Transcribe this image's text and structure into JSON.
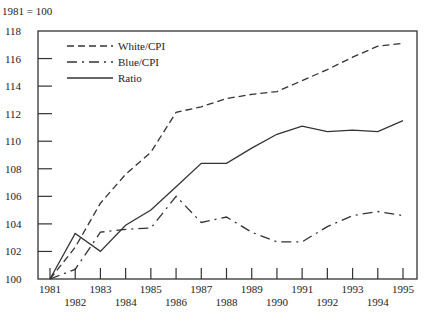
{
  "chart_data": {
    "type": "line",
    "title": "",
    "index_note": "1981 = 100",
    "xlabel": "",
    "ylabel": "",
    "x": [
      1981,
      1982,
      1983,
      1984,
      1985,
      1986,
      1987,
      1988,
      1989,
      1990,
      1991,
      1992,
      1993,
      1994,
      1995
    ],
    "x_tick_labels": [
      "1981",
      "1982",
      "1983",
      "1984",
      "1985",
      "1986",
      "1987",
      "1988",
      "1989",
      "1990",
      "1991",
      "1992",
      "1993",
      "1994",
      "1995"
    ],
    "y_ticks": [
      100,
      102,
      104,
      106,
      108,
      110,
      112,
      114,
      116,
      118
    ],
    "y_tick_labels": [
      "100",
      "102",
      "104",
      "106",
      "108",
      "110",
      "112",
      "114",
      "116",
      "118"
    ],
    "ylim": [
      100,
      118
    ],
    "xlim": [
      1981,
      1995
    ],
    "grid": false,
    "legend_position": "upper-left inside",
    "series": [
      {
        "name": "White/CPI",
        "style": "dashed",
        "values": [
          100.0,
          102.3,
          105.5,
          107.6,
          109.2,
          112.1,
          112.5,
          113.1,
          113.4,
          113.6,
          114.4,
          115.2,
          116.1,
          116.9,
          117.1
        ]
      },
      {
        "name": "Blue/CPI",
        "style": "dash-dot",
        "values": [
          100.0,
          100.7,
          103.4,
          103.6,
          103.7,
          106.0,
          104.1,
          104.5,
          103.4,
          102.7,
          102.7,
          103.8,
          104.6,
          104.9,
          104.6
        ]
      },
      {
        "name": "Ratio",
        "style": "solid",
        "values": [
          100.0,
          103.3,
          102.0,
          103.9,
          105.0,
          106.7,
          108.4,
          108.4,
          109.5,
          110.5,
          111.1,
          110.7,
          110.8,
          110.7,
          111.5
        ]
      }
    ]
  },
  "colors": {
    "line": "#333333",
    "axis": "#333333",
    "background": "#ffffff"
  }
}
